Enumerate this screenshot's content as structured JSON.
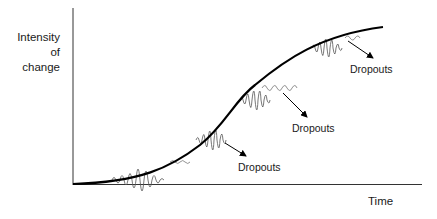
{
  "diagram": {
    "type": "s-curve",
    "y_axis_label_lines": [
      "Intensity",
      "of",
      "change"
    ],
    "x_axis_label": "Time",
    "annotations": [
      {
        "label": "Dropouts",
        "id": "dropouts-1"
      },
      {
        "label": "Dropouts",
        "id": "dropouts-2"
      },
      {
        "label": "Dropouts",
        "id": "dropouts-3"
      }
    ],
    "bursts_count": 4,
    "line_color": "#000000"
  }
}
